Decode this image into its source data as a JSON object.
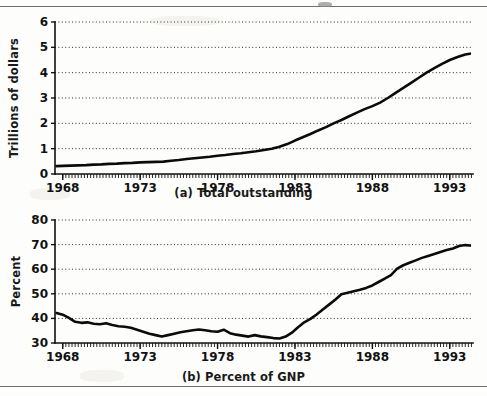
{
  "figure": {
    "panels": [
      {
        "id": "a",
        "caption": "(a) Total outstanding",
        "ylabel": "Trillions of dollars"
      },
      {
        "id": "b",
        "caption": "(b) Percent of GNP",
        "ylabel": "Percent"
      }
    ]
  },
  "chart_data": [
    {
      "type": "line",
      "title": "(a) Total outstanding",
      "xlabel": "",
      "ylabel": "Trillions of dollars",
      "xlim": [
        1967.5,
        1994.5
      ],
      "ylim": [
        0,
        6
      ],
      "yticks": [
        0,
        1,
        2,
        3,
        4,
        5,
        6
      ],
      "xticks": [
        1968,
        1973,
        1978,
        1983,
        1988,
        1993
      ],
      "xtick_labels": [
        "1968",
        "1973",
        "1978",
        "1983",
        "1988",
        "1993"
      ],
      "ytick_labels": [
        "0",
        "1",
        "2",
        "3",
        "4",
        "5",
        "6"
      ],
      "grid": true,
      "grid_axis": "y",
      "minor_xticks_per_major": 5,
      "legend": "none",
      "series": [
        {
          "name": "Total outstanding",
          "color": "#0b0b0b",
          "x": [
            1967.6,
            1968.0,
            1968.5,
            1969.0,
            1969.5,
            1970.0,
            1970.5,
            1971.0,
            1971.5,
            1972.0,
            1972.5,
            1973.0,
            1973.5,
            1974.0,
            1974.5,
            1975.0,
            1975.5,
            1976.0,
            1976.5,
            1977.0,
            1977.5,
            1978.0,
            1978.5,
            1979.0,
            1979.5,
            1980.0,
            1980.5,
            1981.0,
            1981.5,
            1982.0,
            1982.5,
            1983.0,
            1983.5,
            1984.0,
            1984.5,
            1985.0,
            1985.5,
            1986.0,
            1986.5,
            1987.0,
            1987.5,
            1988.0,
            1988.5,
            1989.0,
            1989.5,
            1990.0,
            1990.5,
            1991.0,
            1991.5,
            1992.0,
            1992.5,
            1993.0,
            1993.5,
            1994.0,
            1994.3
          ],
          "y": [
            0.31,
            0.32,
            0.33,
            0.34,
            0.35,
            0.37,
            0.38,
            0.4,
            0.41,
            0.43,
            0.44,
            0.46,
            0.47,
            0.48,
            0.49,
            0.52,
            0.55,
            0.59,
            0.62,
            0.65,
            0.68,
            0.72,
            0.75,
            0.79,
            0.82,
            0.86,
            0.9,
            0.95,
            1.0,
            1.08,
            1.18,
            1.32,
            1.45,
            1.58,
            1.72,
            1.85,
            2.0,
            2.13,
            2.28,
            2.42,
            2.56,
            2.68,
            2.82,
            3.0,
            3.2,
            3.4,
            3.6,
            3.8,
            4.0,
            4.18,
            4.35,
            4.5,
            4.62,
            4.72,
            4.75
          ]
        }
      ]
    },
    {
      "type": "line",
      "title": "(b) Percent of GNP",
      "xlabel": "",
      "ylabel": "Percent",
      "xlim": [
        1967.5,
        1994.5
      ],
      "ylim": [
        30,
        80
      ],
      "yticks": [
        30,
        40,
        50,
        60,
        70,
        80
      ],
      "xticks": [
        1968,
        1973,
        1978,
        1983,
        1988,
        1993
      ],
      "xtick_labels": [
        "1968",
        "1973",
        "1978",
        "1983",
        "1988",
        "1993"
      ],
      "ytick_labels": [
        "30",
        "40",
        "50",
        "60",
        "70",
        "80"
      ],
      "grid": true,
      "grid_axis": "y",
      "minor_xticks_per_major": 5,
      "legend": "none",
      "series": [
        {
          "name": "Percent of GNP",
          "color": "#0b0b0b",
          "x": [
            1967.6,
            1968.0,
            1968.4,
            1968.8,
            1969.2,
            1969.6,
            1970.0,
            1970.4,
            1970.8,
            1971.2,
            1971.6,
            1972.0,
            1972.4,
            1972.8,
            1973.2,
            1973.6,
            1974.0,
            1974.4,
            1974.8,
            1975.2,
            1975.6,
            1976.0,
            1976.4,
            1976.8,
            1977.2,
            1977.6,
            1978.0,
            1978.4,
            1978.8,
            1979.2,
            1979.6,
            1980.0,
            1980.4,
            1980.8,
            1981.2,
            1981.6,
            1982.0,
            1982.4,
            1982.8,
            1983.2,
            1983.6,
            1984.0,
            1984.4,
            1984.8,
            1985.2,
            1985.6,
            1986.0,
            1986.4,
            1986.8,
            1987.2,
            1987.6,
            1988.0,
            1988.4,
            1988.8,
            1989.2,
            1989.6,
            1990.0,
            1990.4,
            1990.8,
            1991.2,
            1991.6,
            1992.0,
            1992.4,
            1992.8,
            1993.2,
            1993.6,
            1994.0,
            1994.3
          ],
          "y": [
            42.2,
            41.5,
            40.2,
            38.6,
            38.2,
            38.4,
            37.8,
            37.6,
            38.0,
            37.3,
            36.8,
            36.6,
            36.2,
            35.4,
            34.6,
            33.8,
            33.2,
            32.6,
            33.2,
            33.8,
            34.4,
            34.8,
            35.2,
            35.5,
            35.2,
            34.8,
            34.6,
            35.4,
            34.0,
            33.4,
            33.0,
            32.6,
            33.2,
            32.7,
            32.4,
            32.0,
            31.8,
            32.6,
            34.2,
            36.4,
            38.4,
            39.8,
            41.6,
            43.6,
            45.6,
            47.6,
            49.8,
            50.4,
            51.0,
            51.6,
            52.4,
            53.4,
            54.8,
            56.2,
            57.6,
            60.2,
            61.6,
            62.6,
            63.6,
            64.6,
            65.4,
            66.2,
            67.0,
            67.8,
            68.4,
            69.4,
            69.8,
            69.6
          ]
        }
      ]
    }
  ]
}
